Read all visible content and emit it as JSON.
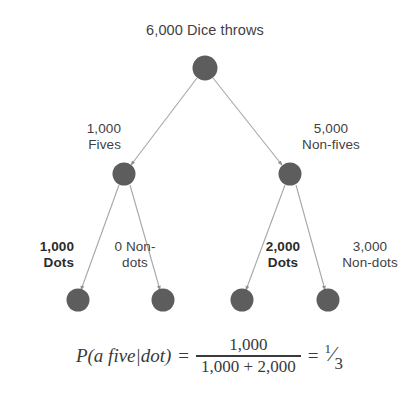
{
  "diagram": {
    "title": "6,000 Dice throws",
    "background_color": "#ffffff",
    "node_color": "#5d5d5d",
    "edge_color": "#a6a6a6",
    "nodes": [
      {
        "id": "root",
        "label": "6,000 Dice throws"
      },
      {
        "id": "fives",
        "count": "1,000",
        "label": "Fives"
      },
      {
        "id": "nonfives",
        "count": "5,000",
        "label": "Non-fives"
      },
      {
        "id": "fives-dots",
        "count": "1,000",
        "label": "Dots"
      },
      {
        "id": "fives-nondots",
        "count": "0",
        "label": "Non-dots"
      },
      {
        "id": "nonfives-dots",
        "count": "2,000",
        "label": "Dots"
      },
      {
        "id": "nonfives-nondots",
        "count": "3,000",
        "label": "Non-dots"
      }
    ],
    "labels": {
      "fives_count": "1,000",
      "fives_text": "Fives",
      "nonfives_count": "5,000",
      "nonfives_text": "Non-fives",
      "dots_left_count": "1,000",
      "dots_left_text": "Dots",
      "nondots_left_count": "0 Non-",
      "nondots_left_text": "dots",
      "dots_right_count": "2,000",
      "dots_right_text": "Dots",
      "nondots_right_count": "3,000",
      "nondots_right_text": "Non-dots"
    }
  },
  "formula": {
    "expression": "P(a five|dot)",
    "equals": "=",
    "numerator": "1,000",
    "denominator": "1,000 + 2,000",
    "equals2": "=",
    "result_numerator": "1",
    "result_slash": "⁄",
    "result_denominator": "3"
  }
}
